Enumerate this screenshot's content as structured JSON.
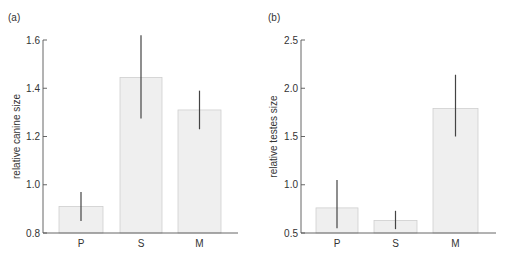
{
  "chart_data": [
    {
      "type": "bar",
      "panel_label": "(a)",
      "title": "",
      "xlabel": "",
      "ylabel": "relative canine size",
      "categories": [
        "P",
        "S",
        "M"
      ],
      "values": [
        0.91,
        1.445,
        1.31
      ],
      "error_low": [
        0.85,
        1.275,
        1.23
      ],
      "error_high": [
        0.97,
        1.62,
        1.39
      ],
      "ylim": [
        0.8,
        1.6
      ],
      "yticks": [
        "0.8",
        "1.0",
        "1.2",
        "1.4",
        "1.6"
      ],
      "grid": false,
      "bar_color": "#efefef"
    },
    {
      "type": "bar",
      "panel_label": "(b)",
      "title": "",
      "xlabel": "",
      "ylabel": "relative testes size",
      "categories": [
        "P",
        "S",
        "M"
      ],
      "values": [
        0.76,
        0.63,
        1.79
      ],
      "error_low": [
        0.55,
        0.54,
        1.5
      ],
      "error_high": [
        1.05,
        0.73,
        2.14
      ],
      "ylim": [
        0.5,
        2.5
      ],
      "yticks": [
        "0.5",
        "1.0",
        "1.5",
        "2.0",
        "2.5"
      ],
      "grid": false,
      "bar_color": "#efefef"
    }
  ]
}
